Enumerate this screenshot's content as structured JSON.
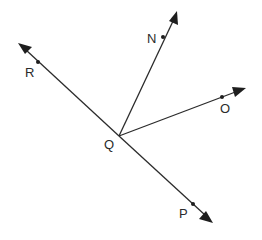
{
  "diagram": {
    "type": "geometry-rays",
    "vertex": {
      "label": "Q",
      "x": 119,
      "y": 136,
      "label_x": 104,
      "label_y": 149
    },
    "rays": [
      {
        "name": "ray-QR",
        "through": {
          "label": "R",
          "x": 38,
          "y": 62,
          "label_x": 25,
          "label_y": 77
        },
        "tip": {
          "x": 20,
          "y": 44
        }
      },
      {
        "name": "ray-QN",
        "through": {
          "label": "N",
          "x": 163,
          "y": 37,
          "label_x": 147,
          "label_y": 43
        },
        "tip": {
          "x": 176,
          "y": 12
        }
      },
      {
        "name": "ray-QO",
        "through": {
          "label": "O",
          "x": 222,
          "y": 97,
          "label_x": 220,
          "label_y": 113
        },
        "tip": {
          "x": 245,
          "y": 88
        }
      },
      {
        "name": "ray-QP",
        "through": {
          "label": "P",
          "x": 193,
          "y": 204,
          "label_x": 179,
          "label_y": 218
        },
        "tip": {
          "x": 212,
          "y": 222
        }
      }
    ],
    "labels": {
      "Q": "Q",
      "R": "R",
      "N": "N",
      "O": "O",
      "P": "P"
    },
    "colors": {
      "line": "#2b2b2b",
      "background": "#ffffff"
    }
  }
}
